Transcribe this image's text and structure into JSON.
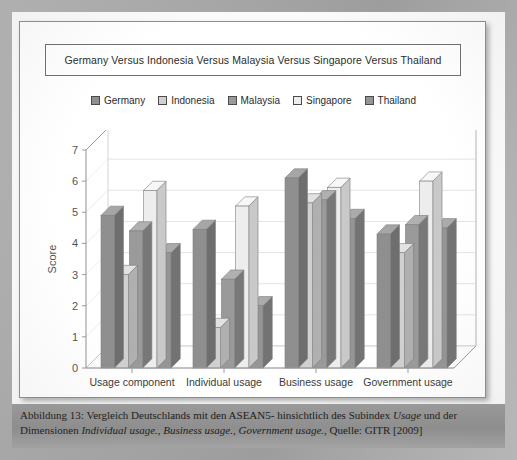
{
  "document": {
    "caption_line1_pre": "Abbildung 13: Vergleich Deutschlands mit den ASEAN5- hinsichtlich des Subindex ",
    "caption_line1_italic": "Usage",
    "caption_line1_post": " und der",
    "caption_line2_pre": "Dimensionen ",
    "caption_line2_italic1": "Individual usage.",
    "caption_line2_mid1": ", ",
    "caption_line2_italic2": "Business usage.",
    "caption_line2_mid2": ", ",
    "caption_line2_italic3": "Government usage.",
    "caption_line2_post": ", Quelle: GITR [2009]"
  },
  "chart_data": {
    "type": "bar",
    "title": "Germany Versus Indonesia Versus Malaysia Versus Singapore Versus Thailand",
    "xlabel": "",
    "ylabel": "Score",
    "ylim": [
      0,
      7
    ],
    "yticks": [
      0,
      1,
      2,
      3,
      4,
      5,
      6,
      7
    ],
    "grid": true,
    "legend_position": "top",
    "three_d": true,
    "categories": [
      "Usage component",
      "Individual usage",
      "Business usage",
      "Government usage"
    ],
    "series": [
      {
        "name": "Germany",
        "color": "#8f8f8f",
        "side_color": "#6e6e6e",
        "top_color": "#a6a6a6",
        "values": [
          4.9,
          4.45,
          6.1,
          4.3
        ]
      },
      {
        "name": "Indonesia",
        "color": "#d0d0d0",
        "side_color": "#b0b0b0",
        "top_color": "#e2e2e2",
        "values": [
          3.0,
          1.3,
          5.3,
          3.7
        ]
      },
      {
        "name": "Malaysia",
        "color": "#9a9a9a",
        "side_color": "#787878",
        "top_color": "#b0b0b0",
        "values": [
          4.4,
          2.85,
          5.4,
          4.6
        ]
      },
      {
        "name": "Singapore",
        "color": "#ededed",
        "side_color": "#c9c9c9",
        "top_color": "#f7f7f7",
        "values": [
          5.7,
          5.2,
          5.8,
          6.0
        ]
      },
      {
        "name": "Thailand",
        "color": "#959595",
        "side_color": "#737373",
        "top_color": "#ababab",
        "values": [
          3.7,
          2.0,
          4.8,
          4.5
        ]
      }
    ]
  },
  "colors": {
    "page_background": "#a8a8a8",
    "paper": "#fbfbfb",
    "panel": "#ffffff",
    "panel_border": "#8e8e8e",
    "axis": "#9a9a9a",
    "text": "#2b2b2b",
    "caption_band": "#979797"
  }
}
